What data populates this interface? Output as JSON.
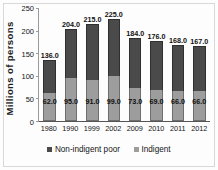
{
  "chart_data": {
    "type": "bar",
    "subtype": "stacked",
    "title": "",
    "xlabel": "",
    "ylabel": "Millions of persons",
    "ylim": [
      0,
      250
    ],
    "yticks": [
      0,
      50,
      100,
      150,
      200,
      250
    ],
    "ytick_labels": [
      "0",
      "50",
      "100",
      "150",
      "200",
      "250"
    ],
    "grid": false,
    "legend_position": "bottom",
    "categories": [
      "1980",
      "1990",
      "1999",
      "2002",
      "2009",
      "2010",
      "2011",
      "2012"
    ],
    "series": [
      {
        "name": "Non-indigent poor",
        "color": "#4a4a4a",
        "values": [
          74.0,
          109.0,
          124.0,
          126.0,
          111.0,
          107.0,
          102.0,
          101.0
        ],
        "labels": [
          "",
          "",
          "",
          "",
          "",
          "",
          "",
          ""
        ]
      },
      {
        "name": "Indigent",
        "color": "#9d9d9d",
        "values": [
          62.0,
          95.0,
          91.0,
          99.0,
          73.0,
          69.0,
          66.0,
          66.0
        ],
        "labels": [
          "62.0",
          "95.0",
          "91.0",
          "99.0",
          "73.0",
          "69.0",
          "66.0",
          "66.0"
        ]
      }
    ],
    "totals": [
      136.0,
      204.0,
      215.0,
      225.0,
      184.0,
      176.0,
      168.0,
      167.0
    ],
    "total_labels": [
      "136.0",
      "204.0",
      "215.0",
      "225.0",
      "184.0",
      "176.0",
      "168.0",
      "167.0"
    ]
  },
  "legend": {
    "entries": [
      {
        "label": "Non-indigent poor",
        "color": "#4a4a4a"
      },
      {
        "label": "Indigent",
        "color": "#9d9d9d"
      }
    ]
  }
}
